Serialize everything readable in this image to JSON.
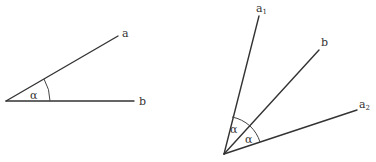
{
  "figure": {
    "left": {
      "rays": [
        {
          "name": "a",
          "label": "a",
          "subscript": ""
        },
        {
          "name": "b",
          "label": "b",
          "subscript": ""
        }
      ],
      "angle_label": "α"
    },
    "right": {
      "rays": [
        {
          "name": "a1",
          "label": "a",
          "subscript": "1"
        },
        {
          "name": "b",
          "label": "b",
          "subscript": ""
        },
        {
          "name": "a2",
          "label": "a",
          "subscript": "2"
        }
      ],
      "angle_labels": [
        "α",
        "α"
      ]
    },
    "colors": {
      "stroke": "#333333",
      "background": "#ffffff"
    }
  }
}
